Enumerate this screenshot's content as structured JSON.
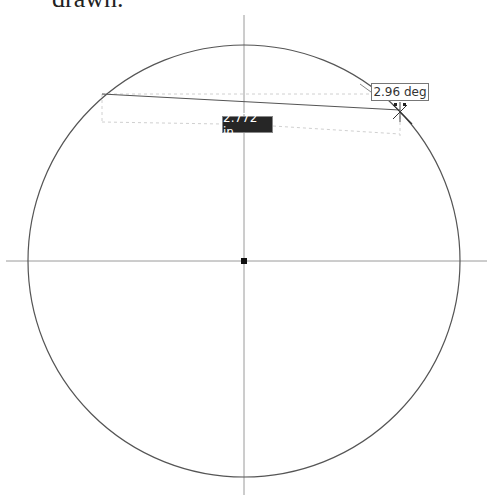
{
  "caption": {
    "text": "drawn."
  },
  "sketch": {
    "center": {
      "x": 244,
      "y": 261
    },
    "radius": 216,
    "center_point_color": "#111111",
    "line_color": "#555555",
    "axis_color": "#999999",
    "horizontal_axis": {
      "x1": 6,
      "x2": 487,
      "y": 261
    },
    "vertical_axis": {
      "x": 244,
      "y1": 15,
      "y2": 495
    },
    "chord": {
      "x1": 102,
      "y1": 94,
      "x2": 400,
      "y2": 110
    },
    "dimension": {
      "length_label": "2.772 in",
      "angle_label": "2.96 deg"
    }
  }
}
